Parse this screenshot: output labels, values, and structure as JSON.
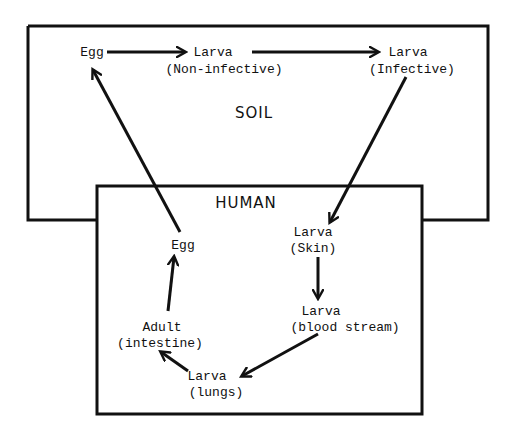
{
  "diagram": {
    "type": "life-cycle flow diagram",
    "regions": {
      "soil": {
        "label": "SOIL"
      },
      "human": {
        "label": "HUMAN"
      }
    },
    "nodes": {
      "soil_egg": {
        "line1": "Egg"
      },
      "soil_larva_noninf": {
        "line1": "Larva",
        "line2": "(Non-infective)"
      },
      "soil_larva_inf": {
        "line1": "Larva",
        "line2": "(Infective)"
      },
      "human_larva_skin": {
        "line1": "Larva",
        "line2": "(Skin)"
      },
      "human_larva_blood": {
        "line1": "Larva",
        "line2": "(blood stream)"
      },
      "human_larva_lungs": {
        "line1": "Larva",
        "line2": "(lungs)"
      },
      "human_adult": {
        "line1": "Adult",
        "line2": "(intestine)"
      },
      "human_egg": {
        "line1": "Egg"
      }
    },
    "edges": [
      {
        "from": "Egg (soil)",
        "to": "Larva (Non-infective)"
      },
      {
        "from": "Larva (Non-infective)",
        "to": "Larva (Infective)"
      },
      {
        "from": "Larva (Infective)",
        "to": "Larva (Skin)"
      },
      {
        "from": "Larva (Skin)",
        "to": "Larva (blood stream)"
      },
      {
        "from": "Larva (blood stream)",
        "to": "Larva (lungs)"
      },
      {
        "from": "Larva (lungs)",
        "to": "Adult (intestine)"
      },
      {
        "from": "Adult (intestine)",
        "to": "Egg (human)"
      },
      {
        "from": "Egg (human)",
        "to": "Egg (soil)"
      }
    ],
    "colors": {
      "stroke": "#111111",
      "background": "#ffffff"
    }
  }
}
